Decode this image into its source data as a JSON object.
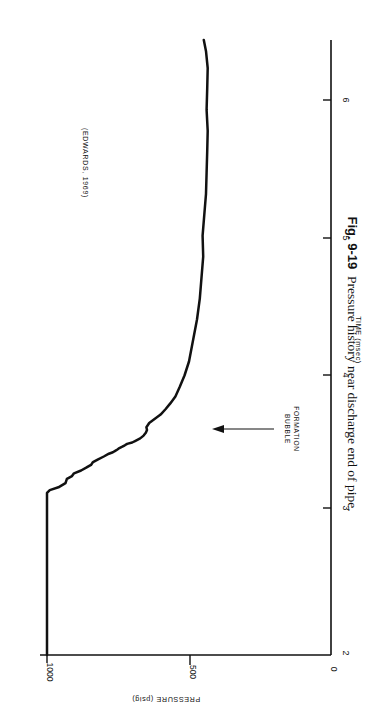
{
  "figure": {
    "caption_number": "Fig. 9-19",
    "caption_text": "Pressure history near discharge end of pipe.",
    "source_note": "(EDWARDS, 1969)",
    "annotation": {
      "line1": "BUBBLE",
      "line2": "FORMATION"
    },
    "orientation": "rotated-90-clockwise",
    "background_color": "#ffffff",
    "ink_color": "#111111"
  },
  "chart_data": {
    "type": "line",
    "title": "Pressure history near discharge end of pipe.",
    "xlabel": "TIME (msec)",
    "ylabel": "PRESSURE (psig)",
    "xlim": [
      2,
      6.4
    ],
    "ylim": [
      0,
      1100
    ],
    "xticks": [
      2,
      3,
      4,
      5,
      6
    ],
    "xtick_labels": [
      "2",
      "3",
      "4",
      "5",
      "6"
    ],
    "yticks": [
      0,
      500,
      1000
    ],
    "ytick_labels": [
      "0",
      "500",
      "1000"
    ],
    "grid": false,
    "legend": false,
    "annotations": [
      {
        "text": "BUBBLE FORMATION",
        "x": 3.52,
        "y": 215,
        "arrow": true
      },
      {
        "text": "(EDWARDS, 1969)",
        "x": 4.6,
        "y": 950,
        "arrow": false
      }
    ],
    "series": [
      {
        "name": "Pressure near discharge end",
        "units_x": "msec",
        "units_y": "psig",
        "x": [
          2.0,
          2.6,
          3.0,
          3.16,
          3.18,
          3.2,
          3.23,
          3.26,
          3.28,
          3.3,
          3.32,
          3.34,
          3.36,
          3.38,
          3.4,
          3.42,
          3.44,
          3.45,
          3.46,
          3.47,
          3.48,
          3.49,
          3.5,
          3.51,
          3.52,
          3.53,
          3.55,
          3.57,
          3.59,
          3.61,
          3.63,
          3.66,
          3.69,
          3.72,
          3.76,
          3.8,
          3.85,
          3.92,
          4.0,
          4.1,
          4.25,
          4.4,
          4.55,
          4.7,
          4.85,
          5.0,
          5.15,
          5.3,
          5.45,
          5.6,
          5.75,
          5.9,
          6.05,
          6.2,
          6.32,
          6.4
        ],
        "y": [
          1000,
          1000,
          1000,
          1000,
          990,
          960,
          935,
          930,
          912,
          905,
          880,
          862,
          845,
          838,
          820,
          800,
          782,
          768,
          760,
          752,
          745,
          735,
          726,
          718,
          700,
          690,
          672,
          660,
          652,
          648,
          650,
          640,
          620,
          600,
          582,
          566,
          548,
          532,
          516,
          500,
          486,
          472,
          462,
          456,
          450,
          452,
          446,
          440,
          438,
          436,
          434,
          438,
          436,
          434,
          440,
          448
        ]
      }
    ]
  }
}
